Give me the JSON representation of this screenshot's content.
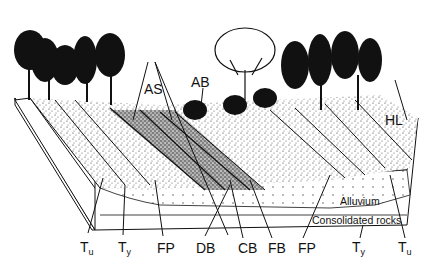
{
  "figure": {
    "type": "block diagram of river valley cross-section",
    "colors": {
      "ink": "#111111",
      "background": "#ffffff",
      "stipple": "#555555"
    }
  },
  "labels": {
    "AS": "AS",
    "AB": "AB",
    "HL": "HL",
    "Tu_left": {
      "main": "T",
      "sub": "u"
    },
    "Ty_left": {
      "main": "T",
      "sub": "y"
    },
    "FP_left": "FP",
    "DB": "DB",
    "CB": "CB",
    "FB": "FB",
    "FP_right": "FP",
    "Ty_right": {
      "main": "T",
      "sub": "y"
    },
    "Tu_right": {
      "main": "T",
      "sub": "u"
    },
    "alluvium": "Alluvium",
    "consolidated_rocks": "Consolidated rocks"
  }
}
